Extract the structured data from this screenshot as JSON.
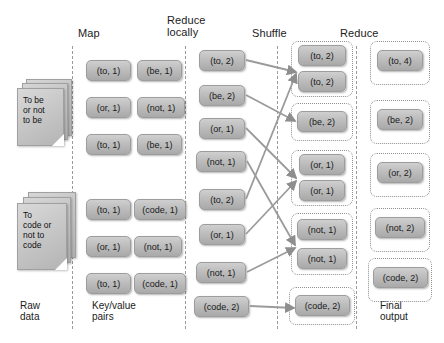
{
  "diagram": {
    "width": 444,
    "height": 343,
    "colors": {
      "box_fill": "#bdbdbd",
      "box_border": "#9d9d9d",
      "dashed_separator": "#9a9a9a",
      "dotted_group": "#8f8f8f",
      "connector": "#8e8e8e",
      "text": "#1a1a1a",
      "background": "#ffffff"
    }
  },
  "column_labels": [
    {
      "id": "map",
      "text": "Map"
    },
    {
      "id": "reduce-locally",
      "text": "Reduce\nlocally"
    },
    {
      "id": "shuffle",
      "text": "Shuffle"
    },
    {
      "id": "reduce",
      "text": "Reduce"
    }
  ],
  "captions": [
    {
      "id": "raw-data",
      "text": "Raw\ndata"
    },
    {
      "id": "key-value",
      "text": "Key/value\npairs"
    },
    {
      "id": "final-output",
      "text": "Final\noutput"
    }
  ],
  "raw_data": [
    {
      "id": "doc-1",
      "text": "To be\nor not\nto be"
    },
    {
      "id": "doc-2",
      "text": "To\ncode or\nnot to\ncode"
    }
  ],
  "map_output": {
    "block_1": [
      {
        "label": "(to, 1)"
      },
      {
        "label": "(be, 1)"
      },
      {
        "label": "(or, 1)"
      },
      {
        "label": "(not, 1)"
      },
      {
        "label": "(to, 1)"
      },
      {
        "label": "(be, 1)"
      }
    ],
    "block_2": [
      {
        "label": "(to, 1)"
      },
      {
        "label": "(code, 1)"
      },
      {
        "label": "(or, 1)"
      },
      {
        "label": "(not, 1)"
      },
      {
        "label": "(to, 1)"
      },
      {
        "label": "(code, 1)"
      }
    ]
  },
  "reduce_locally": [
    {
      "label": "(to, 2)"
    },
    {
      "label": "(be, 2)"
    },
    {
      "label": "(or, 1)"
    },
    {
      "label": "(not, 1)"
    },
    {
      "label": "(to, 2)"
    },
    {
      "label": "(or, 1)"
    },
    {
      "label": "(not, 1)"
    },
    {
      "label": "(code, 2)"
    }
  ],
  "shuffle_groups": [
    {
      "key": "to",
      "items": [
        {
          "label": "(to, 2)"
        },
        {
          "label": "(to, 2)"
        }
      ]
    },
    {
      "key": "be",
      "items": [
        {
          "label": "(be, 2)"
        }
      ]
    },
    {
      "key": "or",
      "items": [
        {
          "label": "(or, 1)"
        },
        {
          "label": "(or, 1)"
        }
      ]
    },
    {
      "key": "not",
      "items": [
        {
          "label": "(not, 1)"
        },
        {
          "label": "(not, 1)"
        }
      ]
    },
    {
      "key": "code",
      "items": [
        {
          "label": "(code, 2)"
        }
      ]
    }
  ],
  "final_output": [
    {
      "key": "to",
      "label": "(to, 4)"
    },
    {
      "key": "be",
      "label": "(be, 2)"
    },
    {
      "key": "or",
      "label": "(or, 2)"
    },
    {
      "key": "not",
      "label": "(not, 2)"
    },
    {
      "key": "code",
      "label": "(code, 2)"
    }
  ]
}
